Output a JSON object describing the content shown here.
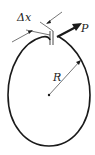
{
  "diagram": {
    "labels": {
      "dx": "Δx",
      "force": "P",
      "radius": "R"
    },
    "colors": {
      "stroke": "#1a1a1a",
      "background": "#ffffff"
    }
  }
}
